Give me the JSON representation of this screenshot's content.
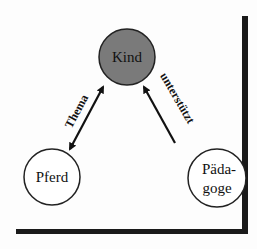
{
  "diagram": {
    "nodes": [
      {
        "id": "kind",
        "label": "Kind",
        "fill": "#7a7a7a",
        "stroke": "#222222",
        "cx": 127,
        "cy": 57,
        "r": 28
      },
      {
        "id": "pferd",
        "label": "Pferd",
        "fill": "#ffffff",
        "stroke": "#222222",
        "cx": 52,
        "cy": 177,
        "r": 28
      },
      {
        "id": "paedagoge",
        "label_line1": "Päda-",
        "label_line2": "goge",
        "fill": "#ffffff",
        "stroke": "#222222",
        "cx": 217,
        "cy": 178,
        "r": 29
      }
    ],
    "edges": [
      {
        "from": "pferd",
        "to": "kind",
        "label": "Thema",
        "direction": "both"
      },
      {
        "from": "paedagoge",
        "to": "kind",
        "label": "unterstützt",
        "direction": "to-kind"
      }
    ],
    "frame": {
      "shadow_color": "#1a1a1a"
    }
  }
}
